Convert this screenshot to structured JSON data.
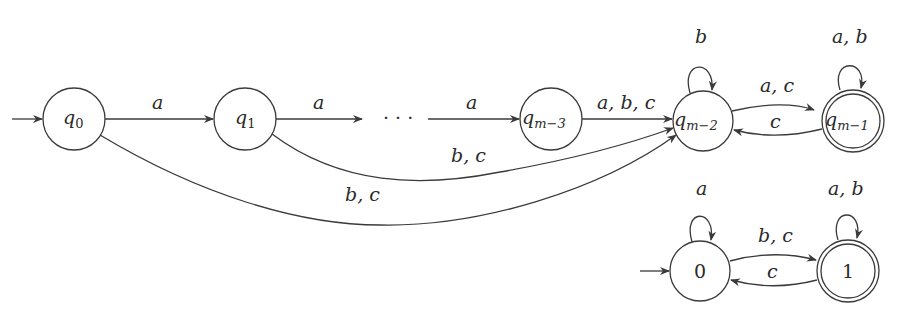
{
  "automaton_top": {
    "states": [
      {
        "id": "q0",
        "label": "q",
        "sub": "0",
        "initial": true,
        "accepting": false
      },
      {
        "id": "q1",
        "label": "q",
        "sub": "1",
        "initial": false,
        "accepting": false
      },
      {
        "id": "qm3",
        "label": "q",
        "sub": "m−3",
        "initial": false,
        "accepting": false
      },
      {
        "id": "qm2",
        "label": "q",
        "sub": "m−2",
        "initial": false,
        "accepting": false
      },
      {
        "id": "qm1",
        "label": "q",
        "sub": "m−1",
        "initial": false,
        "accepting": true
      }
    ],
    "ellipsis": "· · ·",
    "transitions": [
      {
        "from": "q0",
        "to": "q1",
        "label": "a"
      },
      {
        "from": "q1",
        "to": "...",
        "label": "a"
      },
      {
        "from": "...",
        "to": "qm3",
        "label": "a"
      },
      {
        "from": "qm3",
        "to": "qm2",
        "label": "a, b, c"
      },
      {
        "from": "q1",
        "to": "qm2",
        "label": "b, c"
      },
      {
        "from": "q0",
        "to": "qm2",
        "label": "b, c"
      },
      {
        "from": "qm2",
        "to": "qm2",
        "label": "b"
      },
      {
        "from": "qm2",
        "to": "qm1",
        "label": "a, c"
      },
      {
        "from": "qm1",
        "to": "qm2",
        "label": "c"
      },
      {
        "from": "qm1",
        "to": "qm1",
        "label": "a, b"
      }
    ]
  },
  "automaton_bottom": {
    "states": [
      {
        "id": "s0",
        "label": "0",
        "initial": true,
        "accepting": false
      },
      {
        "id": "s1",
        "label": "1",
        "initial": false,
        "accepting": true
      }
    ],
    "transitions": [
      {
        "from": "s0",
        "to": "s0",
        "label": "a"
      },
      {
        "from": "s0",
        "to": "s1",
        "label": "b, c"
      },
      {
        "from": "s1",
        "to": "s0",
        "label": "c"
      },
      {
        "from": "s1",
        "to": "s1",
        "label": "a, b"
      }
    ]
  }
}
